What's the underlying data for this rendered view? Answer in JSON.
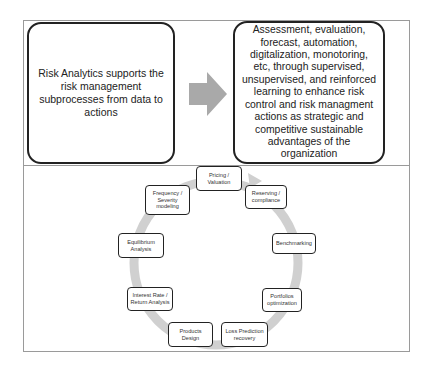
{
  "top": {
    "left_box": {
      "text": "Risk Analytics supports the risk management subprocesses from data to actions"
    },
    "arrow": {
      "icon": "right-arrow-icon",
      "color": "#a9a9a9"
    },
    "right_box": {
      "text": "Assessment, evaluation, forecast, automation, digitalization, monotoring, etc, through supervised, unsupervised, and reinforced learning to enhance risk control and risk managment actions as strategic and competitive sustainable advantages of the organization"
    }
  },
  "cycle": {
    "ring_color": "#d0d0d0",
    "nodes": [
      {
        "label": "Pricing / Valuation"
      },
      {
        "label": "Reserving / compliance"
      },
      {
        "label": "Benchmarking"
      },
      {
        "label": "Portfolios optimization"
      },
      {
        "label": "Loss Prediction recovery"
      },
      {
        "label": "Products Design"
      },
      {
        "label": "Interest Rate / Return Analysis"
      },
      {
        "label": "Equilibrium Analysis"
      },
      {
        "label": "Frequency / Severity modeling"
      }
    ]
  }
}
